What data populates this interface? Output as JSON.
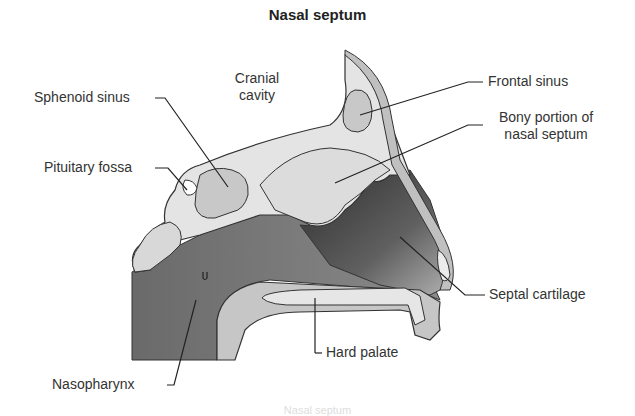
{
  "title": "Nasal septum",
  "labels": {
    "cranial_cavity_1": "Cranial",
    "cranial_cavity_2": "cavity",
    "frontal_sinus": "Frontal sinus",
    "bony_portion_1": "Bony portion of",
    "bony_portion_2": "nasal septum",
    "sphenoid_sinus": "Sphenoid sinus",
    "pituitary_fossa": "Pituitary fossa",
    "septal_cartilage": "Septal cartilage",
    "hard_palate": "Hard palate",
    "nasopharynx": "Nasopharynx"
  },
  "caption": "Nasal septum",
  "colors": {
    "bone_light": "#e4e4e4",
    "sinus": "#c8c8c8",
    "soft_tissue": "#bdbdbd",
    "cavity_dark": "#6e6e6e",
    "cartilage_dark": "#444444",
    "outline": "#333333",
    "text": "#333333"
  }
}
